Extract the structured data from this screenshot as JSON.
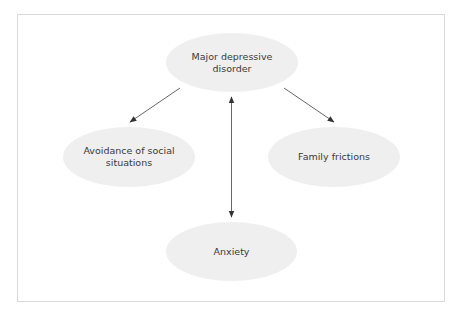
{
  "diagram": {
    "type": "concept-map",
    "frame": {
      "border_color": "#d9d9d9",
      "background": "#ffffff"
    },
    "node_fill": "#efefef",
    "text_color": "#3a3a3a",
    "edge_color": "#555555",
    "nodes": [
      {
        "id": "mdd",
        "label": "Major depressive disorder",
        "line1": "Major depressive",
        "line2": "disorder"
      },
      {
        "id": "avoid",
        "label": "Avoidance of social situations",
        "line1": "Avoidance of social",
        "line2": "situations"
      },
      {
        "id": "family",
        "label": "Family frictions",
        "line1": "Family frictions"
      },
      {
        "id": "anxiety",
        "label": "Anxiety",
        "line1": "Anxiety"
      }
    ],
    "edges": [
      {
        "from": "mdd",
        "to": "avoid",
        "direction": "forward"
      },
      {
        "from": "mdd",
        "to": "family",
        "direction": "forward"
      },
      {
        "from": "mdd",
        "to": "anxiety",
        "direction": "bidirectional"
      }
    ]
  }
}
